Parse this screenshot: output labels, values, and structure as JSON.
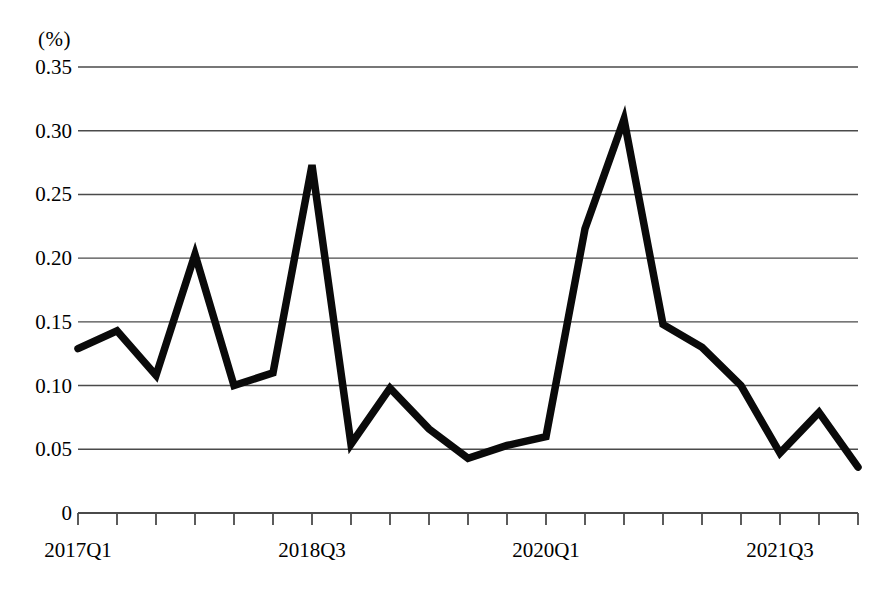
{
  "chart_data": {
    "type": "line",
    "title": "",
    "subtitle": "",
    "xlabel": "",
    "ylabel": "",
    "unit_label": "(%)",
    "ylim": [
      0,
      0.35
    ],
    "ytick_labels": [
      "0.35",
      "0.30",
      "0.25",
      "0.20",
      "0.15",
      "0.10",
      "0.05",
      "0"
    ],
    "ytick_values": [
      0.35,
      0.3,
      0.25,
      0.2,
      0.15,
      0.1,
      0.05,
      0
    ],
    "grid": true,
    "grid_axis": "y",
    "legend": false,
    "legend_position": "none",
    "line_color": "#0a0a0a",
    "grid_color": "#4a4a4a",
    "x": [
      "2017Q1",
      "2017Q2",
      "2017Q3",
      "2017Q4",
      "2018Q1",
      "2018Q2",
      "2018Q3",
      "2018Q4",
      "2019Q1",
      "2019Q2",
      "2019Q3",
      "2019Q4",
      "2020Q1",
      "2020Q2",
      "2020Q3",
      "2020Q4",
      "2021Q1",
      "2021Q2",
      "2021Q3",
      "2021Q4",
      "2022Q1"
    ],
    "xtick_labels_shown": [
      "2017Q1",
      "2018Q3",
      "2020Q1",
      "2021Q3"
    ],
    "xtick_label_indices": [
      0,
      6,
      12,
      18
    ],
    "values": [
      0.129,
      0.143,
      0.108,
      0.203,
      0.1,
      0.11,
      0.273,
      0.054,
      0.098,
      0.066,
      0.043,
      0.053,
      0.06,
      0.223,
      0.309,
      0.148,
      0.13,
      0.1,
      0.047,
      0.079,
      0.036
    ],
    "n_points": 21,
    "min_value": 0.036,
    "max_value": 0.309
  }
}
